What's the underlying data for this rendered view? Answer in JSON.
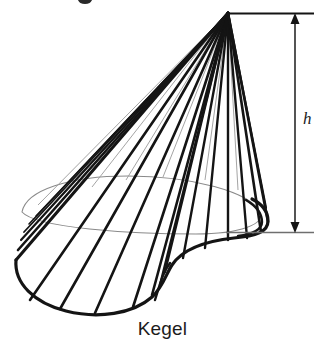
{
  "figure": {
    "caption": "Kegel",
    "height_label": "h",
    "stroke_color": "#141414",
    "guide_color": "#7d7d7d",
    "background_color": "#ffffff",
    "apex": {
      "x": 228,
      "y": 13
    },
    "dimension_line": {
      "top_y": 13,
      "bottom_y": 232,
      "axis_x": 295,
      "left_x": 228,
      "right_x": 314,
      "arrow_up": true,
      "arrow_down": true
    },
    "base_outline_note": "irregular closed base curve (kidney / blob shaped directrix)",
    "ruling_count": 18,
    "elements": {
      "cone_surface": "cone-surface",
      "base_curve": "base-curve",
      "guide_ellipse": "guide-ellipse",
      "height_arrow": "height-dimension-arrow",
      "top_reference_line": "top-reference-line",
      "bottom_reference_line": "bottom-reference-line"
    }
  }
}
